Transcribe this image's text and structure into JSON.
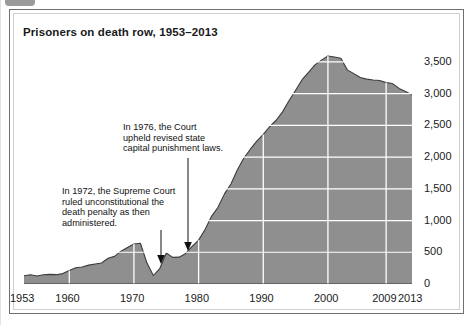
{
  "figure": {
    "title": "Prisoners on death row, 1953–2013",
    "corner_tab_icon": "tab-marker"
  },
  "chart_data": {
    "type": "area",
    "title": "Prisoners on death row, 1953–2013",
    "xlabel": "",
    "ylabel": "",
    "xlim": [
      1953,
      2013
    ],
    "ylim": [
      0,
      3750
    ],
    "grid": true,
    "grid_color": "#ffffff",
    "area_fill": "#8f8f8f",
    "line_color": "#3b3b3b",
    "legend": null,
    "xticks": [
      1953,
      1960,
      1970,
      1980,
      1990,
      2000,
      2009,
      2013
    ],
    "xtick_labels": [
      "1953",
      "1960",
      "1970",
      "1980",
      "1990",
      "2000",
      "2009",
      "2013"
    ],
    "yticks": [
      0,
      500,
      1000,
      1500,
      2000,
      2500,
      3000,
      3500
    ],
    "ytick_labels": [
      "0",
      "500",
      "1,000",
      "1,500",
      "2,000",
      "2,500",
      "3,000",
      "3,500"
    ],
    "series": [
      {
        "name": "Prisoners on death row",
        "x": [
          1953,
          1954,
          1955,
          1956,
          1957,
          1958,
          1959,
          1960,
          1961,
          1962,
          1963,
          1964,
          1965,
          1966,
          1967,
          1968,
          1969,
          1970,
          1971,
          1972,
          1973,
          1974,
          1975,
          1976,
          1977,
          1978,
          1979,
          1980,
          1981,
          1982,
          1983,
          1984,
          1985,
          1986,
          1987,
          1988,
          1989,
          1990,
          1991,
          1992,
          1993,
          1994,
          1995,
          1996,
          1997,
          1998,
          1999,
          2000,
          2001,
          2002,
          2003,
          2004,
          2005,
          2006,
          2007,
          2008,
          2009,
          2010,
          2011,
          2012,
          2013
        ],
        "values": [
          131,
          147,
          125,
          146,
          151,
          147,
          164,
          212,
          257,
          267,
          297,
          315,
          331,
          406,
          435,
          517,
          575,
          631,
          642,
          334,
          134,
          244,
          488,
          420,
          423,
          482,
          593,
          691,
          860,
          1066,
          1209,
          1420,
          1575,
          1800,
          1984,
          2124,
          2250,
          2356,
          2482,
          2580,
          2716,
          2890,
          3054,
          3219,
          3335,
          3452,
          3527,
          3593,
          3577,
          3557,
          3374,
          3315,
          3254,
          3228,
          3215,
          3207,
          3173,
          3158,
          3082,
          3033,
          2979
        ]
      }
    ],
    "annotations": [
      {
        "id": "annot-1972",
        "text": "In 1972, the Supreme Court\nruled unconstitutional the\ndeath penalty as then\nadministered.",
        "points_to_year": 1973,
        "arrow": "down"
      },
      {
        "id": "annot-1976",
        "text": "In 1976, the Court\nupheld revised state\ncapital punishment laws.",
        "points_to_year": 1977,
        "arrow": "down"
      }
    ]
  }
}
